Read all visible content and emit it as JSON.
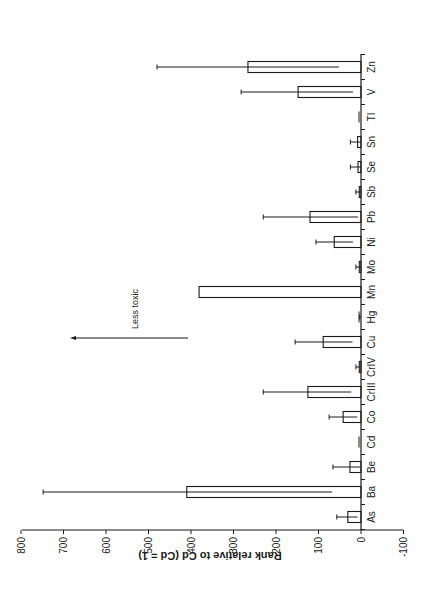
{
  "chart_data": {
    "type": "bar",
    "orientation": "rotated-90-ccw",
    "title": "",
    "xlabel": "",
    "ylabel": "Rank relative to Cd (Cd = 1)",
    "ylim": [
      -100,
      800
    ],
    "yticks": [
      800,
      700,
      600,
      500,
      400,
      300,
      200,
      100,
      0,
      -100
    ],
    "grid": false,
    "legend": null,
    "categories": [
      "As",
      "Ba",
      "Be",
      "Cd",
      "Co",
      "CrIII",
      "CrIV",
      "Cu",
      "Hg",
      "Mn",
      "Mo",
      "Ni",
      "Pb",
      "Sb",
      "Se",
      "Sn",
      "Tl",
      "V",
      "Zn"
    ],
    "values": [
      31,
      410,
      26,
      1,
      42,
      125,
      4,
      89,
      1,
      381,
      4,
      63,
      120,
      4,
      7,
      8,
      1,
      148,
      266
    ],
    "error_upper": [
      57,
      748,
      66,
      1,
      75,
      230,
      12,
      155,
      3,
      381,
      12,
      106,
      230,
      12,
      25,
      25,
      1,
      282,
      480
    ],
    "error_lower": [
      8,
      68,
      2,
      1,
      9,
      23,
      1,
      20,
      0,
      381,
      1,
      19,
      7,
      1,
      1,
      1,
      1,
      19,
      52
    ],
    "annotations": [
      {
        "text": "Less toxic",
        "type": "arrow",
        "from_value": 420,
        "to_value": 685,
        "direction": "toward higher values"
      }
    ]
  }
}
